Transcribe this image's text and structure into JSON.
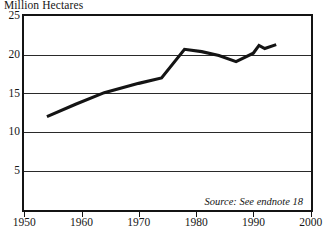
{
  "chart_data": {
    "type": "line",
    "title": "Million Hectares",
    "xlabel": "",
    "ylabel": "Million Hectares",
    "xlim": [
      1950,
      2000
    ],
    "ylim": [
      0,
      25
    ],
    "yticks": [
      5,
      10,
      15,
      20,
      25
    ],
    "ytick_labels": [
      "5",
      "10",
      "15",
      "20",
      "25"
    ],
    "xticks": [
      1950,
      1960,
      1970,
      1980,
      1990,
      2000
    ],
    "xtick_labels": [
      "1950",
      "1960",
      "1970",
      "1980",
      "1990",
      "2000"
    ],
    "grid": "horizontal",
    "legend": "none",
    "line_color": "#141414",
    "annotation": "Source: See endnote 18",
    "series": [
      {
        "name": "Area",
        "x": [
          1954,
          1959,
          1964,
          1970,
          1974,
          1978,
          1981,
          1984,
          1987,
          1990,
          1991,
          1992,
          1994
        ],
        "values": [
          12.0,
          13.6,
          15.1,
          16.3,
          17.0,
          20.7,
          20.4,
          19.9,
          19.1,
          20.2,
          21.2,
          20.8,
          21.3
        ]
      }
    ]
  },
  "axes": {
    "y_labels": [
      "25",
      "20",
      "15",
      "10",
      "5"
    ],
    "x_labels": [
      "1950",
      "1960",
      "1970",
      "1980",
      "1990",
      "2000"
    ]
  },
  "notes": {
    "source": "Source: See endnote 18"
  }
}
